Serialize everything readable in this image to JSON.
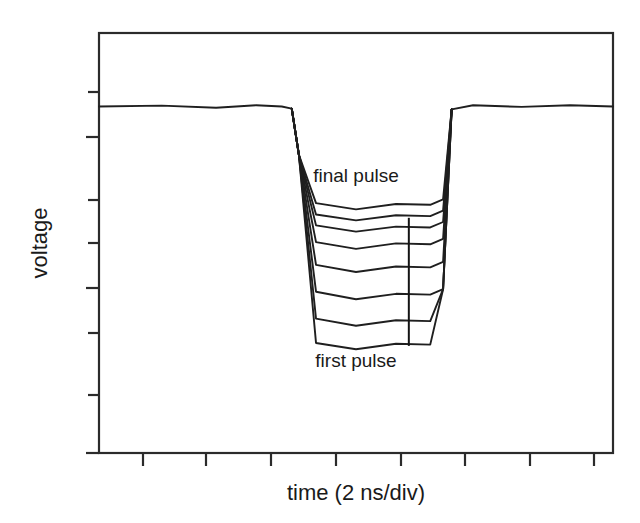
{
  "figure": {
    "background_color": "#ffffff",
    "line_color": "#1f1f1f",
    "frame_color": "#2b2b2b",
    "x_axis_title": "time (2 ns/div)",
    "y_axis_title": "voltage",
    "annotation_top": "final pulse",
    "annotation_bottom": "first pulse"
  },
  "chart_data": {
    "type": "line",
    "title": "",
    "xlabel": "time (2 ns/div)",
    "ylabel": "voltage",
    "xlim": [
      0,
      18
    ],
    "ylim": [
      0,
      10
    ],
    "grid": false,
    "legend": "none",
    "annotations": [
      {
        "text": "final pulse",
        "x": 9.0,
        "y": 6.45,
        "note": "label above the shallowest (last) pulse trace"
      },
      {
        "text": "first pulse",
        "x": 9.0,
        "y": 2.05,
        "note": "label below the deepest (first) pulse trace"
      },
      {
        "text": "",
        "type": "vertical-marker",
        "x": 10.85,
        "y_from": 2.55,
        "y_to": 5.6,
        "note": "vertical tick marker spanning the pulse depth spread"
      }
    ],
    "axis_ticks": {
      "x_tick_count": 8,
      "x_tick_direction": "outward",
      "x_tick_labels": [],
      "y_tick_count": 6,
      "y_tick_direction": "outward",
      "y_tick_labels": []
    },
    "series": [
      {
        "name": "first pulse",
        "order": 1,
        "baseline_level": 8.25,
        "pulse_bottom_level": 2.55,
        "x": [
          0,
          2.2,
          4.1,
          5.5,
          6.4,
          6.75,
          7.0,
          7.6,
          9.0,
          10.4,
          11.6,
          12.05,
          12.35,
          13.1,
          14.8,
          16.5,
          18
        ],
        "y": [
          8.25,
          8.27,
          8.22,
          8.28,
          8.25,
          8.2,
          7.1,
          2.62,
          2.47,
          2.6,
          2.58,
          3.9,
          8.18,
          8.28,
          8.24,
          8.28,
          8.25
        ]
      },
      {
        "name": "pulse 2",
        "order": 2,
        "baseline_level": 8.25,
        "pulse_bottom_level": 3.12,
        "x": [
          6.75,
          7.0,
          7.6,
          9.0,
          10.4,
          11.6,
          12.05,
          12.35
        ],
        "y": [
          8.2,
          7.1,
          3.2,
          3.03,
          3.16,
          3.14,
          3.9,
          8.18
        ]
      },
      {
        "name": "pulse 3",
        "order": 3,
        "baseline_level": 8.25,
        "pulse_bottom_level": 3.75,
        "x": [
          6.75,
          7.0,
          7.6,
          9.0,
          10.4,
          11.6,
          12.05,
          12.35
        ],
        "y": [
          8.2,
          7.1,
          3.84,
          3.66,
          3.79,
          3.77,
          3.9,
          8.18
        ]
      },
      {
        "name": "pulse 4",
        "order": 4,
        "baseline_level": 8.25,
        "pulse_bottom_level": 4.4,
        "x": [
          6.75,
          7.0,
          7.6,
          9.0,
          10.4,
          11.6,
          12.05,
          12.35
        ],
        "y": [
          8.2,
          7.1,
          4.48,
          4.31,
          4.44,
          4.42,
          4.55,
          8.18
        ]
      },
      {
        "name": "pulse 5",
        "order": 5,
        "baseline_level": 8.25,
        "pulse_bottom_level": 4.95,
        "x": [
          6.75,
          7.0,
          7.6,
          9.0,
          10.4,
          11.6,
          12.05,
          12.35
        ],
        "y": [
          8.2,
          7.1,
          5.02,
          4.86,
          4.99,
          4.97,
          5.1,
          8.18
        ]
      },
      {
        "name": "pulse 6",
        "order": 6,
        "baseline_level": 8.25,
        "pulse_bottom_level": 5.35,
        "x": [
          6.75,
          7.0,
          7.6,
          9.0,
          10.4,
          11.6,
          12.05,
          12.35
        ],
        "y": [
          8.2,
          7.1,
          5.42,
          5.27,
          5.39,
          5.37,
          5.5,
          8.18
        ]
      },
      {
        "name": "pulse 7",
        "order": 7,
        "baseline_level": 8.25,
        "pulse_bottom_level": 5.62,
        "x": [
          6.75,
          7.0,
          7.6,
          9.0,
          10.4,
          11.6,
          12.05,
          12.35
        ],
        "y": [
          8.2,
          7.1,
          5.68,
          5.54,
          5.66,
          5.64,
          5.77,
          8.18
        ]
      },
      {
        "name": "final pulse",
        "order": 8,
        "baseline_level": 8.25,
        "pulse_bottom_level": 5.9,
        "x": [
          6.75,
          7.0,
          7.6,
          9.0,
          10.4,
          11.6,
          12.05,
          12.35
        ],
        "y": [
          8.2,
          7.1,
          5.95,
          5.8,
          5.93,
          5.91,
          6.04,
          8.18
        ]
      }
    ]
  }
}
